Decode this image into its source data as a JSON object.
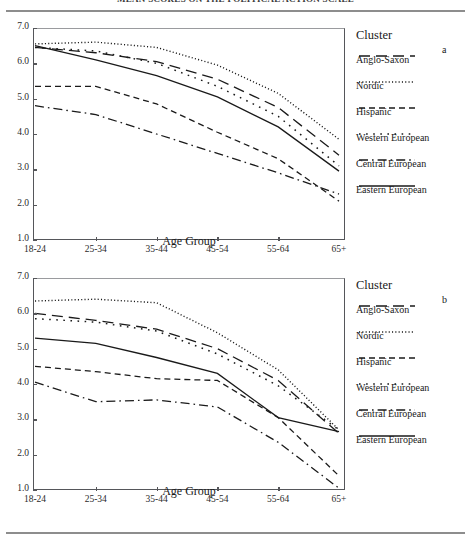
{
  "figure": {
    "title": "MEAN SCORES ON THE POLITICAL ACTION SCALE",
    "xlabel": "Age Group",
    "legend_title": "Cluster",
    "panel_a_letter": "a",
    "panel_b_letter": "b",
    "ytick_labels": [
      "7.0",
      "6.0",
      "5.0",
      "4.0",
      "3.0",
      "2.0",
      "1.0"
    ],
    "xtick_labels": [
      "18-24",
      "25-34",
      "35-44",
      "45-54",
      "55-64",
      "65+"
    ],
    "axis_color": "#55565a",
    "line_color": "#1a1a1a"
  },
  "legend": {
    "title": "Cluster",
    "entries": [
      {
        "label": "Anglo-Saxon",
        "dash": "long-dash"
      },
      {
        "label": "Nordic",
        "dash": "fine-dot"
      },
      {
        "label": "Hispanic",
        "dash": "medium-dash"
      },
      {
        "label": "Western European",
        "dash": "sparse-dot"
      },
      {
        "label": "Central European",
        "dash": "dash-dot"
      },
      {
        "label": "Eastern European",
        "dash": "solid"
      }
    ]
  },
  "chart_data": [
    {
      "type": "line",
      "panel": "a",
      "title": "MEAN SCORES ON THE POLITICAL ACTION SCALE",
      "xlabel": "Age Group",
      "ylabel": "",
      "categories": [
        "18-24",
        "25-34",
        "35-44",
        "45-54",
        "55-64",
        "65+"
      ],
      "ylim": [
        1.0,
        7.0
      ],
      "yticks": [
        1.0,
        2.0,
        3.0,
        4.0,
        5.0,
        6.0,
        7.0
      ],
      "grid": false,
      "legend_position": "right",
      "series": [
        {
          "name": "Anglo-Saxon",
          "dash": "long-dash",
          "values": [
            6.45,
            6.3,
            6.05,
            5.55,
            4.75,
            3.4
          ]
        },
        {
          "name": "Nordic",
          "dash": "fine-dot",
          "values": [
            6.55,
            6.6,
            6.45,
            5.95,
            5.15,
            3.85
          ]
        },
        {
          "name": "Hispanic",
          "dash": "medium-dash",
          "values": [
            5.35,
            5.35,
            4.85,
            4.05,
            3.3,
            2.1
          ]
        },
        {
          "name": "Western European",
          "dash": "sparse-dot",
          "values": [
            6.45,
            6.35,
            6.0,
            5.35,
            4.5,
            3.1
          ]
        },
        {
          "name": "Central European",
          "dash": "dash-dot",
          "values": [
            4.8,
            4.55,
            4.0,
            3.45,
            2.9,
            2.3
          ]
        },
        {
          "name": "Eastern European",
          "dash": "solid",
          "values": [
            6.5,
            6.1,
            5.65,
            5.05,
            4.2,
            2.95
          ]
        }
      ]
    },
    {
      "type": "line",
      "panel": "b",
      "title": "MEAN SCORES ON THE POLITICAL ACTION SCALE",
      "xlabel": "Age Group",
      "ylabel": "",
      "categories": [
        "18-24",
        "25-34",
        "35-44",
        "45-54",
        "55-64",
        "65+"
      ],
      "ylim": [
        1.0,
        7.0
      ],
      "yticks": [
        1.0,
        2.0,
        3.0,
        4.0,
        5.0,
        6.0,
        7.0
      ],
      "grid": false,
      "legend_position": "right",
      "series": [
        {
          "name": "Anglo-Saxon",
          "dash": "long-dash",
          "values": [
            6.0,
            5.8,
            5.55,
            5.0,
            4.1,
            2.6
          ]
        },
        {
          "name": "Nordic",
          "dash": "fine-dot",
          "values": [
            6.35,
            6.4,
            6.3,
            5.45,
            4.4,
            2.7
          ]
        },
        {
          "name": "Hispanic",
          "dash": "medium-dash",
          "values": [
            4.5,
            4.35,
            4.15,
            4.1,
            3.05,
            1.4
          ]
        },
        {
          "name": "Western European",
          "dash": "sparse-dot",
          "values": [
            5.85,
            5.75,
            5.5,
            4.85,
            3.95,
            2.7
          ]
        },
        {
          "name": "Central European",
          "dash": "dash-dot",
          "values": [
            4.05,
            3.5,
            3.55,
            3.35,
            2.35,
            1.05
          ]
        },
        {
          "name": "Eastern European",
          "dash": "solid",
          "values": [
            5.3,
            5.15,
            4.75,
            4.3,
            3.05,
            2.65
          ]
        }
      ]
    }
  ]
}
